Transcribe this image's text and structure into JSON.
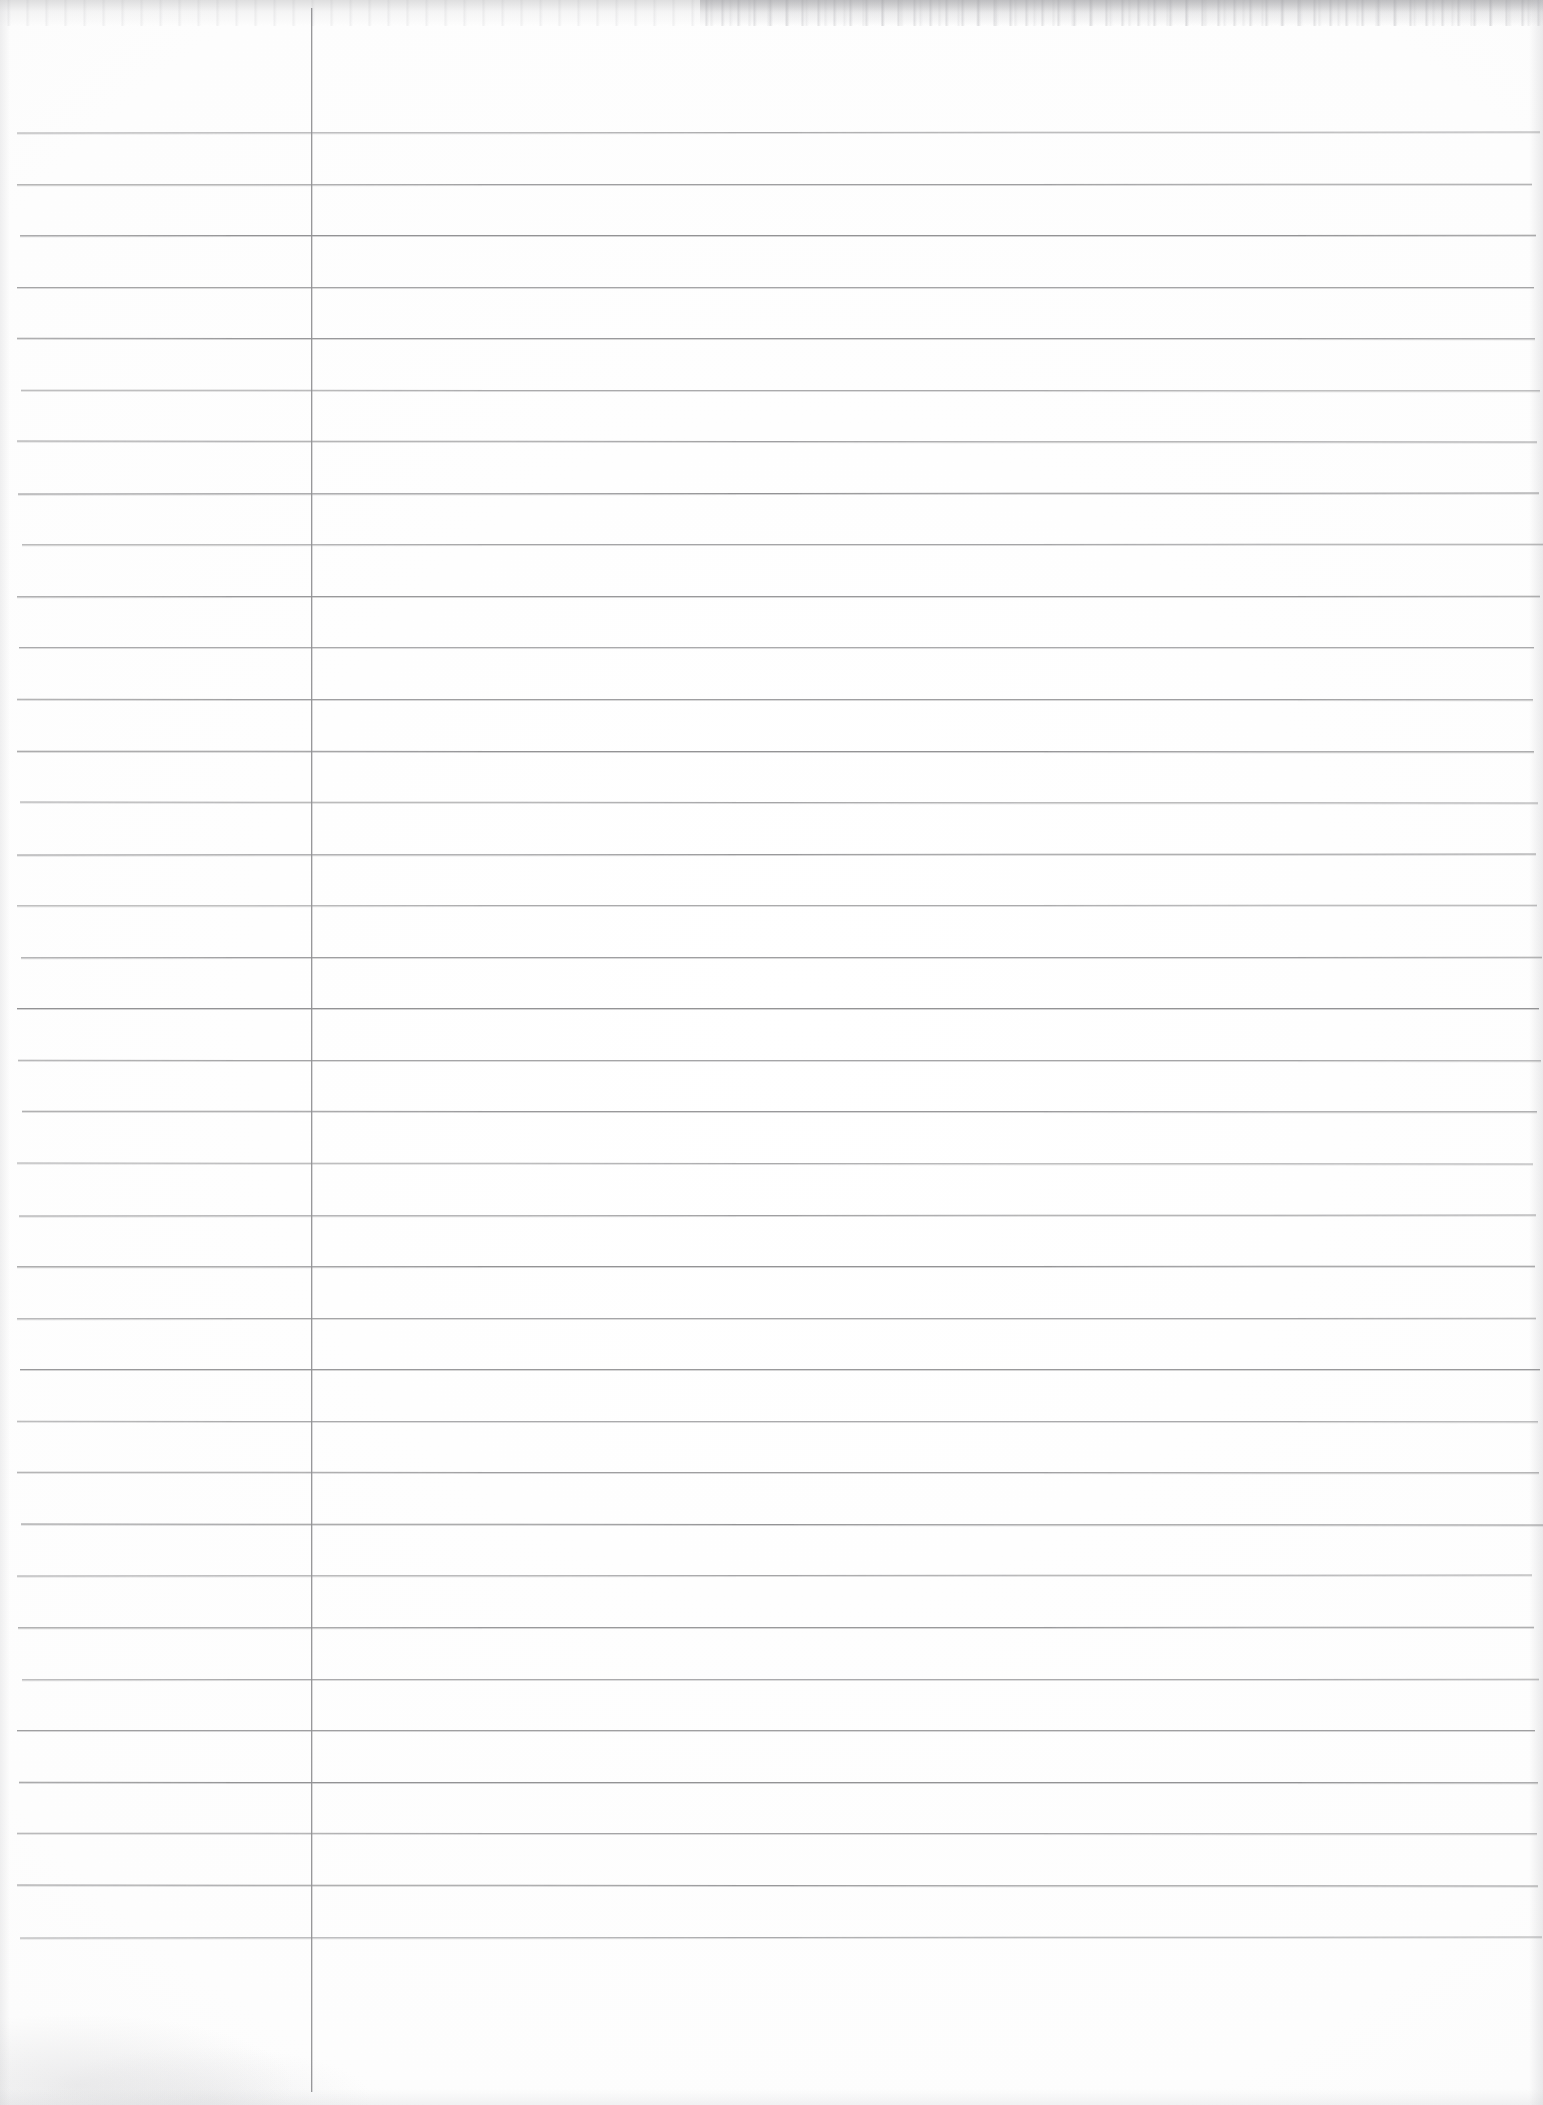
{
  "document": {
    "kind": "scanned-ruled-notebook-page",
    "title": "",
    "written_content": "",
    "page_number": "",
    "date_field": "",
    "is_blank": true,
    "paper_color": "#fdfdfd",
    "rule_color": "#8b8b8d",
    "margin_rule_color": "#8e8e90"
  },
  "page": {
    "width": 1543,
    "height": 2105
  },
  "margin_rule": {
    "x": 311,
    "y_start": 8,
    "y_end": 2092,
    "thickness": 1,
    "orientation": "vertical",
    "label": ""
  },
  "ruling": {
    "line_count": 36,
    "first_line_y": 132,
    "spacing": 51.6,
    "x_start": 17,
    "x_end": 1540,
    "thickness": 1,
    "line_y_positions": [
      132,
      184,
      235,
      287,
      338,
      390,
      441,
      493,
      544,
      596,
      647,
      699,
      751,
      802,
      854,
      905,
      957,
      1008,
      1060,
      1111,
      1163,
      1215,
      1266,
      1318,
      1369,
      1421,
      1472,
      1524,
      1575,
      1627,
      1679,
      1730,
      1782,
      1833,
      1885,
      1937
    ]
  },
  "regions": {
    "header_area_label": "",
    "left_margin_label": "",
    "body_label": "",
    "footer_area_label": ""
  }
}
